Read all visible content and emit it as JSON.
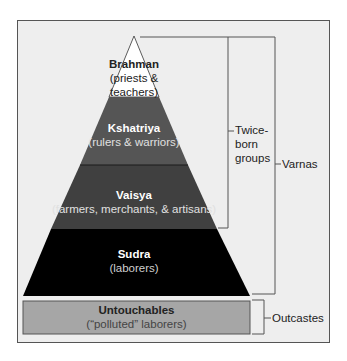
{
  "diagram": {
    "type": "pyramid",
    "layers": [
      {
        "name": "Brahman",
        "description": "(priests & teachers)",
        "desc_line1": "(priests &",
        "desc_line2": "teachers)",
        "color": "#ffffff",
        "text_color": "#222222"
      },
      {
        "name": "Kshatriya",
        "description": "(rulers & warriors)",
        "color": "#555555",
        "text_color": "#ffffff"
      },
      {
        "name": "Vaisya",
        "description": "(farmers, merchants, & artisans)",
        "color": "#3f3f3f",
        "text_color": "#ffffff"
      },
      {
        "name": "Sudra",
        "description": "(laborers)",
        "color": "#000000",
        "text_color": "#ffffff"
      }
    ],
    "outcaste_layer": {
      "name": "Untouchables",
      "description": "(“polluted” laborers)",
      "color": "#a6a6a6",
      "text_color": "#222222"
    },
    "brackets": [
      {
        "label": "Twice-born groups",
        "line1": "Twice-",
        "line2": "born",
        "line3": "groups",
        "spans": [
          "Brahman",
          "Kshatriya",
          "Vaisya"
        ]
      },
      {
        "label": "Varnas",
        "spans": [
          "Brahman",
          "Kshatriya",
          "Vaisya",
          "Sudra"
        ]
      },
      {
        "label": "Outcastes",
        "spans": [
          "Untouchables"
        ]
      }
    ],
    "background_color": "#eeeeee",
    "line_color": "#555555"
  }
}
